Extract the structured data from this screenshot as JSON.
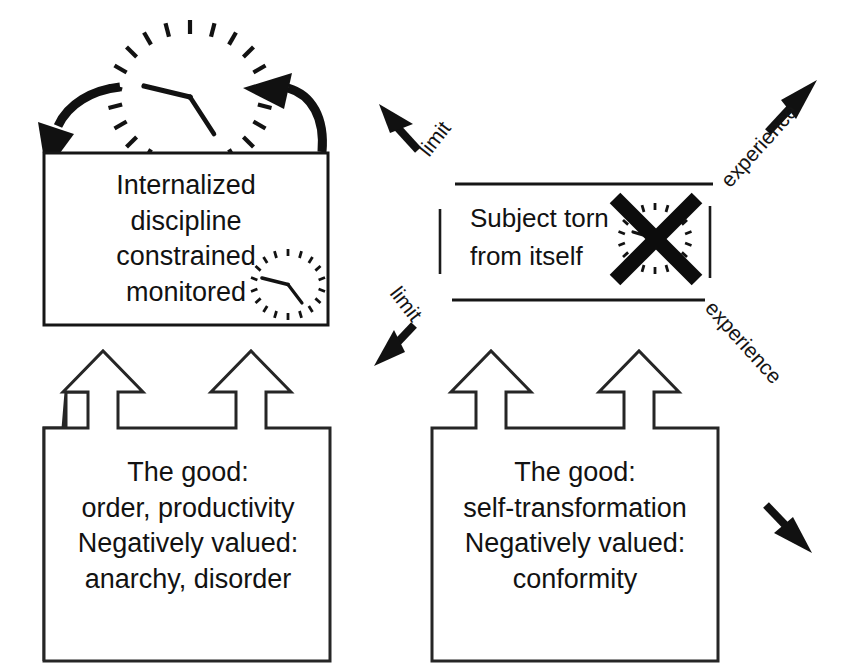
{
  "diagram": {
    "ink_color": "#121212",
    "background_color": "#ffffff"
  },
  "top_left_box": {
    "name": "internalized-discipline-box",
    "lines": [
      "Internalized",
      "discipline",
      "constrained",
      "monitored"
    ],
    "icon": "clock-icon"
  },
  "top_arrows": {
    "left_arrow": "curved-arrow-down-left",
    "right_arrow": "curved-arrow-up-left",
    "clock": "clock-icon"
  },
  "center_right": {
    "name": "subject-torn-region",
    "lines": [
      "Subject torn",
      "from itself"
    ],
    "icon": "crossed-out-clock-icon"
  },
  "diagonals": {
    "upper_left": "limit",
    "lower_left": "limit",
    "upper_right": "experience",
    "lower_right": "experience"
  },
  "bottom_left_box": {
    "name": "order-productivity-box",
    "lines": [
      "The good:",
      "order, productivity",
      "Negatively valued:",
      "anarchy, disorder"
    ],
    "arrow_count": 2
  },
  "bottom_right_box": {
    "name": "self-transformation-box",
    "lines": [
      "The good:",
      "self-transformation",
      "Negatively valued:",
      "conformity"
    ],
    "arrow_count": 2
  }
}
